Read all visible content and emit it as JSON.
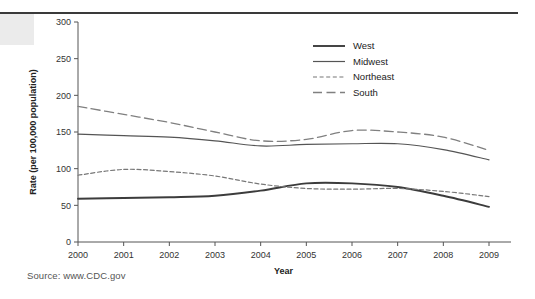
{
  "figure": {
    "source_note": "Source: www.CDC.gov"
  },
  "chart_data": {
    "type": "line",
    "title": "",
    "xlabel": "Year",
    "ylabel": "Rate (per 100,000 population)",
    "x": [
      2000,
      2001,
      2002,
      2003,
      2004,
      2005,
      2006,
      2007,
      2008,
      2009
    ],
    "xtick_labels": [
      "2000",
      "2001",
      "2002",
      "2003",
      "2004",
      "2005",
      "2006",
      "2007",
      "2008",
      "2009"
    ],
    "ytick_labels": [
      "0",
      "50",
      "100",
      "150",
      "200",
      "250",
      "300"
    ],
    "yticks": [
      0,
      50,
      100,
      150,
      200,
      250,
      300
    ],
    "ylim": [
      0,
      300
    ],
    "xlim": [
      2000,
      2009
    ],
    "grid": false,
    "legend_position": "top-right",
    "series": [
      {
        "name": "West",
        "style": "solid-thick",
        "color": "#3c3c3c",
        "values": [
          59,
          60,
          61,
          63,
          70,
          80,
          80,
          75,
          63,
          48
        ]
      },
      {
        "name": "Midwest",
        "style": "solid-thin",
        "color": "#555555",
        "values": [
          147,
          145,
          143,
          138,
          131,
          133,
          134,
          134,
          126,
          112
        ]
      },
      {
        "name": "Northeast",
        "style": "dotted",
        "color": "#777777",
        "values": [
          91,
          99,
          96,
          90,
          79,
          73,
          72,
          73,
          69,
          62
        ]
      },
      {
        "name": "South",
        "style": "dashed",
        "color": "#808080",
        "values": [
          185,
          174,
          163,
          150,
          138,
          140,
          152,
          150,
          143,
          125
        ]
      }
    ]
  }
}
